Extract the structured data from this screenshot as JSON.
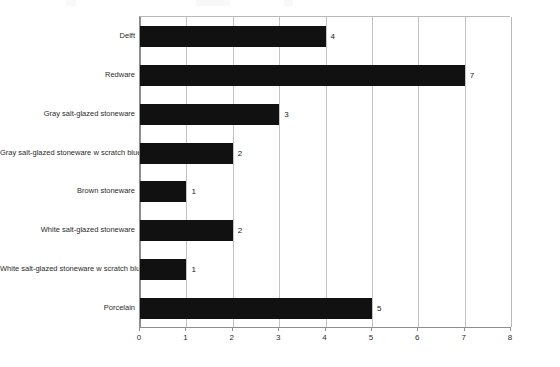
{
  "chart_data": {
    "type": "bar",
    "orientation": "horizontal",
    "title": "",
    "subtitle": "",
    "xlabel": "",
    "ylabel": "",
    "xlim": [
      0,
      8
    ],
    "ylim": null,
    "grid": true,
    "gridlines_axis": "x",
    "legend": false,
    "legend_position": "none",
    "xticks": [
      "0",
      "1",
      "2",
      "3",
      "4",
      "5",
      "6",
      "7",
      "8"
    ],
    "value_labels": true,
    "bar_color": "#111111",
    "categories": [
      "Delft",
      "Redware",
      "Gray salt-glazed stoneware",
      "Gray salt-glazed stoneware w scratch blue",
      "Brown stoneware",
      "White salt-glazed stoneware",
      "White salt-glazed stoneware w scratch blue",
      "Porcelain"
    ],
    "values": [
      4,
      7,
      3,
      2,
      1,
      2,
      1,
      5
    ],
    "points": [
      {
        "category": "Delft",
        "value": 4,
        "label": "4"
      },
      {
        "category": "Redware",
        "value": 7,
        "label": "7"
      },
      {
        "category": "Gray salt-glazed stoneware",
        "value": 3,
        "label": "3"
      },
      {
        "category": "Gray salt-glazed stoneware w scratch blue",
        "value": 2,
        "label": "2"
      },
      {
        "category": "Brown stoneware",
        "value": 1,
        "label": "1"
      },
      {
        "category": "White salt-glazed stoneware",
        "value": 2,
        "label": "2"
      },
      {
        "category": "White salt-glazed stoneware w scratch blue",
        "value": 1,
        "label": "1"
      },
      {
        "category": "Porcelain",
        "value": 5,
        "label": "5"
      }
    ]
  },
  "colors": {
    "bar": "#111111",
    "grid": "#c2c2c7",
    "axis": "#8d8d92",
    "text": "#2b2b2b",
    "background": "#ffffff"
  }
}
